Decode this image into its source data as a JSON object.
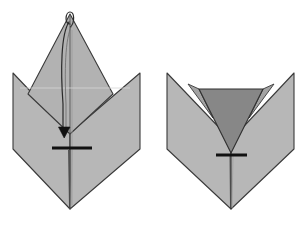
{
  "figure": {
    "type": "paper-folding-instruction",
    "panel_count": 2,
    "canvas": {
      "width": 308,
      "height": 229
    },
    "background_color": "#ffffff"
  },
  "colors": {
    "paper_light": "#b7b7b7",
    "paper_mid": "#a6a6a6",
    "paper_dark": "#878787",
    "paper_peak": "#b2b2b2",
    "outline": "#3a3a3a",
    "crease_line": "#555555",
    "valley_line": "#8a8a8a",
    "arrow_color": "#1a1a1a",
    "bar_color": "#111111",
    "white": "#ffffff"
  },
  "panels": [
    {
      "id": "panel-left",
      "label": "Before fold",
      "shapes": {
        "left_wing": {
          "name": "left-wing-flap",
          "fill": "paper_light",
          "points": "13,73 70,133 70,209 13,149"
        },
        "right_wing": {
          "name": "right-wing-flap",
          "fill": "paper_light",
          "points": "140,73 140,149 70,209 70,133"
        },
        "center_peak": {
          "name": "center-peak-triangle",
          "fill": "paper_peak",
          "points": "70,14 113,94 70,134 28,94"
        }
      },
      "lines": {
        "center_crease": {
          "name": "center-vertical-crease",
          "x1": 70,
          "y1": 14,
          "x2": 70,
          "y2": 209
        },
        "fold_horizontal": {
          "name": "horizontal-fold-bar",
          "x1": 52,
          "y1": 148,
          "x2": 92,
          "y2": 148,
          "width": 3
        }
      },
      "arrow": {
        "name": "fold-direction-arrow",
        "path": "M 70,18 C 62,26 62,60 64,100 L 64,126",
        "head_tip_x": 64,
        "head_tip_y": 136,
        "head_width": 11,
        "head_height": 10
      },
      "loop": {
        "name": "arrow-start-loop",
        "cx": 70,
        "cy": 17,
        "rx": 4.2,
        "ry": 5.5
      }
    },
    {
      "id": "panel-right",
      "label": "After fold",
      "shapes": {
        "left_wing": {
          "name": "left-wing-flap",
          "fill": "paper_light",
          "points": "167,73 231,140 231,209 167,149"
        },
        "right_wing": {
          "name": "right-wing-flap",
          "fill": "paper_light",
          "points": "294,73 294,149 231,209 231,140"
        },
        "folded_flap": {
          "name": "folded-down-flap",
          "fill": "paper_dark",
          "points": "199,89 263,89 231,153"
        },
        "left_notch": {
          "name": "left-notch-facet",
          "fill": "paper_mid",
          "points": "188,84 199,89 213,118"
        },
        "right_notch": {
          "name": "right-notch-facet",
          "fill": "paper_mid",
          "points": "274,84 263,89 249,118"
        }
      },
      "lines": {
        "center_crease": {
          "name": "center-vertical-crease",
          "x1": 231,
          "y1": 153,
          "x2": 231,
          "y2": 209
        },
        "fold_horizontal": {
          "name": "horizontal-fold-bar",
          "x1": 216,
          "y1": 155,
          "x2": 247,
          "y2": 155,
          "width": 3
        }
      }
    }
  ]
}
